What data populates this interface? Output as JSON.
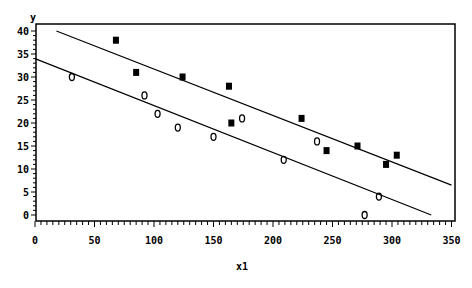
{
  "chart_data": {
    "type": "scatter",
    "title": "",
    "xlabel": "x1",
    "ylabel": "y",
    "xlim": [
      0,
      350
    ],
    "ylim": [
      0,
      40
    ],
    "x_ticks": [
      0,
      50,
      100,
      150,
      200,
      250,
      300,
      350
    ],
    "x_tick_labels": [
      "0",
      "50",
      "100",
      "150",
      "200",
      "250",
      "300",
      "350"
    ],
    "y_ticks": [
      0,
      5,
      10,
      15,
      20,
      25,
      30,
      35,
      40
    ],
    "y_tick_labels": [
      "0",
      "5",
      "10",
      "15",
      "20",
      "25",
      "30",
      "35",
      "40"
    ],
    "grid": false,
    "legend": null,
    "series": [
      {
        "name": "filled",
        "marker": "filled-square",
        "points": [
          {
            "x": 68,
            "y": 38
          },
          {
            "x": 85,
            "y": 31
          },
          {
            "x": 124,
            "y": 30
          },
          {
            "x": 163,
            "y": 28
          },
          {
            "x": 165,
            "y": 20
          },
          {
            "x": 224,
            "y": 21
          },
          {
            "x": 245,
            "y": 14
          },
          {
            "x": 271,
            "y": 15
          },
          {
            "x": 295,
            "y": 11
          },
          {
            "x": 304,
            "y": 13
          }
        ]
      },
      {
        "name": "open",
        "marker": "open-circle",
        "points": [
          {
            "x": 31,
            "y": 30
          },
          {
            "x": 92,
            "y": 26
          },
          {
            "x": 103,
            "y": 22
          },
          {
            "x": 120,
            "y": 19
          },
          {
            "x": 150,
            "y": 17
          },
          {
            "x": 174,
            "y": 21
          },
          {
            "x": 209,
            "y": 12
          },
          {
            "x": 237,
            "y": 16
          },
          {
            "x": 289,
            "y": 4
          },
          {
            "x": 277,
            "y": 0
          }
        ]
      }
    ],
    "lines": [
      {
        "name": "upper-fit",
        "x1": 18,
        "y1": 40,
        "x2": 350,
        "y2": 6.5
      },
      {
        "name": "lower-fit",
        "x1": 0,
        "y1": 34,
        "x2": 333,
        "y2": 0
      }
    ]
  }
}
